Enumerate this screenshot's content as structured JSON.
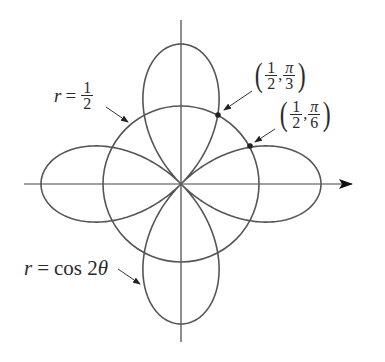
{
  "figure": {
    "type": "polar-plot",
    "origin_px": [
      181,
      184
    ],
    "unit_px": 140,
    "axes": {
      "x_axis": {
        "from_px": 24,
        "to_px": 352,
        "arrow": "right"
      },
      "y_axis": {
        "from_px": 20,
        "to_px": 342,
        "arrow": "none"
      }
    },
    "curves": [
      {
        "name": "rose",
        "equation": "r = cos 2θ",
        "petals": 4,
        "stroke": "#555555"
      },
      {
        "name": "circle",
        "equation": "r = 1/2",
        "radius": 0.5,
        "stroke": "#555555",
        "radius_px": 78
      }
    ],
    "intersection_points": [
      {
        "label": "(1/2, π/3)",
        "r": "1/2",
        "theta": "π/3",
        "px": [
          218,
          115
        ]
      },
      {
        "label": "(1/2, π/6)",
        "r": "1/2",
        "theta": "π/6",
        "px": [
          250,
          146
        ]
      }
    ]
  },
  "labels": {
    "circle": {
      "lhs": "r",
      "eq": "=",
      "num": "1",
      "den": "2"
    },
    "rose": {
      "lhs": "r",
      "eq": "=",
      "rhs": "cos 2",
      "theta": "θ"
    },
    "point1": {
      "lparen": "(",
      "num": "1",
      "den": "2",
      "comma": ",",
      "pnum": "π",
      "pden": "3",
      "rparen": ")"
    },
    "point2": {
      "lparen": "(",
      "num": "1",
      "den": "2",
      "comma": ",",
      "pnum": "π",
      "pden": "6",
      "rparen": ")"
    }
  },
  "colors": {
    "ink": "#2b2b2b",
    "curve": "#555555",
    "axis": "#444444"
  }
}
